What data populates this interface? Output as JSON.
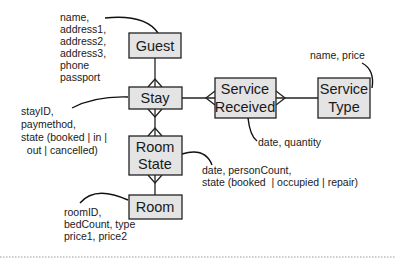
{
  "diagram": {
    "type": "entity-relationship",
    "entities": {
      "guest": {
        "label": [
          "Guest"
        ]
      },
      "stay": {
        "label": [
          "Stay"
        ]
      },
      "room_state": {
        "label": [
          "Room",
          "State"
        ]
      },
      "room": {
        "label": [
          "Room"
        ]
      },
      "service_received": {
        "label": [
          "Service",
          "Received"
        ]
      },
      "service_type": {
        "label": [
          "Service",
          "Type"
        ]
      }
    },
    "attributes": {
      "guest": [
        "name,",
        "address1,",
        "address2,",
        "address3,",
        "phone",
        "passport"
      ],
      "stay": [
        "stayID,",
        "paymethod,",
        "state (booked | in |",
        "  out | cancelled)"
      ],
      "room_state": [
        "date, personCount,",
        "state (booked  | occupied | repair)"
      ],
      "room": [
        "roomID,",
        "bedCount, type",
        "price1, price2"
      ],
      "service_received": [
        "date, quantity"
      ],
      "service_type": [
        "name, price"
      ]
    },
    "relationships": [
      {
        "from": "guest",
        "to": "stay",
        "cardinality": "one-to-many"
      },
      {
        "from": "stay",
        "to": "room_state",
        "cardinality": "many-to-many"
      },
      {
        "from": "room",
        "to": "room_state",
        "cardinality": "one-to-many"
      },
      {
        "from": "stay",
        "to": "service_received",
        "cardinality": "one-to-many"
      },
      {
        "from": "service_type",
        "to": "service_received",
        "cardinality": "one-to-many"
      }
    ]
  }
}
